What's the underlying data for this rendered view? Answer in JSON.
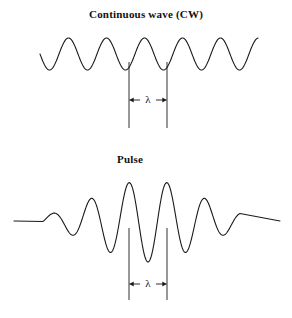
{
  "figure": {
    "width": 292,
    "height": 318,
    "background_color": "#ffffff",
    "stroke_color": "#1a1a1a"
  },
  "panels": [
    {
      "id": "cw",
      "title": "Continuous wave (CW)",
      "wavelength_label": "λ"
    },
    {
      "id": "pulse",
      "title": "Pulse",
      "wavelength_label": "λ"
    }
  ],
  "chart_data": [
    {
      "type": "line",
      "title": "Continuous wave (CW)",
      "xlabel": "",
      "ylabel": "",
      "annotations": [
        "λ"
      ],
      "waveform": "sinusoid",
      "x_start": 40,
      "x_end": 258,
      "baseline_y": 54,
      "amplitude": 16,
      "wavelength_px": 38,
      "cycles": 5.74,
      "phase_deg": 180,
      "marker_lines_x": [
        129,
        167
      ],
      "marker_line_top_y": 62,
      "marker_line_bottom_y": 128,
      "arrow_y": 100,
      "grid": false,
      "legend": "none"
    },
    {
      "type": "line",
      "title": "Pulse",
      "xlabel": "",
      "ylabel": "",
      "annotations": [
        "λ"
      ],
      "waveform": "gaussian-enveloped sinusoid",
      "x_start": 14,
      "x_end": 280,
      "packet_x_start": 43,
      "packet_x_end": 240,
      "baseline_y": 221,
      "peak_amplitude": 41,
      "envelope_center_x": 148,
      "envelope_sigma_px": 52,
      "wavelength_px": 38,
      "phase_deg": 180,
      "marker_lines_x": [
        129,
        167
      ],
      "marker_line_top_y": 228,
      "marker_line_bottom_y": 300,
      "arrow_y": 284,
      "grid": false,
      "legend": "none"
    }
  ]
}
